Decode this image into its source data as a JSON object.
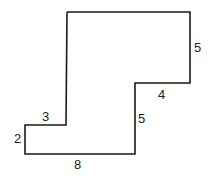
{
  "diagram": {
    "type": "rectilinear-polygon",
    "stroke_color": "#1a1a1a",
    "labels": {
      "top_right_vertical": "5",
      "middle_horizontal": "4",
      "inner_vertical": "5",
      "left_horizontal": "3",
      "left_vertical": "2",
      "bottom_horizontal": "8"
    }
  }
}
